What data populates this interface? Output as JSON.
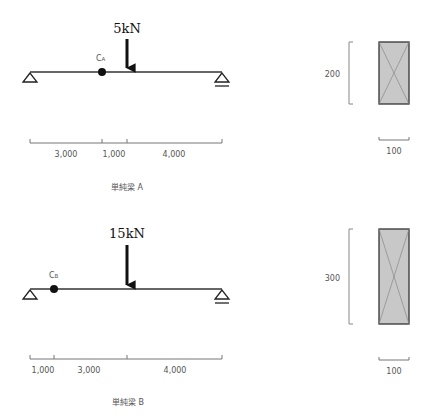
{
  "beam_a": {
    "title": "単純梁 A",
    "load_label": "5kN",
    "point_label": "C",
    "point_sub": "A",
    "spans": [
      "3,000",
      "1,000",
      "4,000"
    ],
    "section": {
      "height_label": "200",
      "width_label": "100"
    }
  },
  "beam_b": {
    "title": "単純梁 B",
    "load_label": "15kN",
    "point_label": "C",
    "point_sub": "B",
    "spans": [
      "1,000",
      "3,000",
      "4,000"
    ],
    "section": {
      "height_label": "300",
      "width_label": "100"
    }
  },
  "colors": {
    "beam": "#333333",
    "dimension": "#777777",
    "section_fill": "#c8c8c8",
    "section_stroke": "#333333"
  }
}
